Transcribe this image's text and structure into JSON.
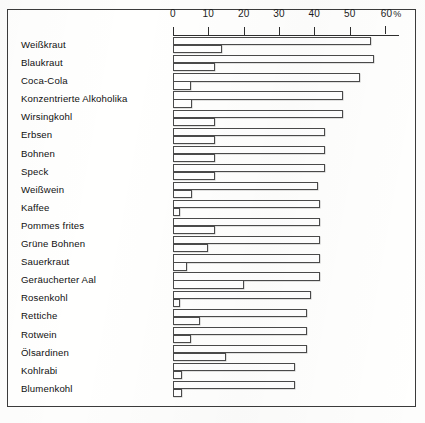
{
  "chart_data": {
    "type": "bar",
    "title": "",
    "subtitle": "",
    "xlabel": "",
    "ylabel": "",
    "orientation": "horizontal",
    "grid": false,
    "legend_position": "none",
    "xlim": [
      0,
      60
    ],
    "xticks": [
      0,
      10,
      20,
      30,
      40,
      50,
      60
    ],
    "xtick_labels": [
      "0",
      "10",
      "20",
      "30",
      "40",
      "50",
      "60"
    ],
    "xunit": "%",
    "xaxis_unit_suffix": "%",
    "categories": [
      "Weißkraut",
      "Blaukraut",
      "Coca-Cola",
      "Konzentrierte Alkoholika",
      "Wirsingkohl",
      "Erbsen",
      "Bohnen",
      "Speck",
      "Weißwein",
      "Kaffee",
      "Pommes frites",
      "Grüne Bohnen",
      "Sauerkraut",
      "Geräucherter Aal",
      "Rosenkohl",
      "Rettiche",
      "Rotwein",
      "Ölsardinen",
      "Kohlrabi",
      "Blumenkohl"
    ],
    "series": [
      {
        "name": "upper",
        "values": [
          56,
          57,
          53,
          48,
          48,
          43,
          43,
          43,
          41,
          41.5,
          41.5,
          41.5,
          41.5,
          41.5,
          39,
          38,
          38,
          38,
          34.5,
          34.5
        ]
      },
      {
        "name": "lower",
        "values": [
          14,
          12,
          5,
          5.5,
          12,
          12,
          12,
          12,
          5.5,
          2,
          12,
          10,
          4,
          20,
          2,
          7.5,
          5,
          15,
          2.5,
          2.5
        ]
      }
    ]
  },
  "axis": {
    "tick_labels": [
      "0",
      "10",
      "20",
      "30",
      "40",
      "50",
      "60"
    ],
    "unit": "%"
  }
}
